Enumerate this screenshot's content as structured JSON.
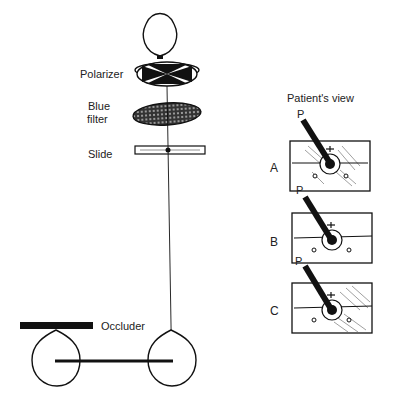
{
  "apparatus": {
    "labels": {
      "polarizer": "Polarizer",
      "blue_filter_line1": "Blue",
      "blue_filter_line2": "filter",
      "slide": "Slide",
      "occluder": "Occluder"
    }
  },
  "patient_view": {
    "title": "Patient's view",
    "panels": [
      {
        "label": "A",
        "pointer": "P"
      },
      {
        "label": "B",
        "pointer": "P"
      },
      {
        "label": "C",
        "pointer": "P"
      }
    ]
  },
  "colors": {
    "ink": "#111111",
    "paper": "#ffffff"
  }
}
